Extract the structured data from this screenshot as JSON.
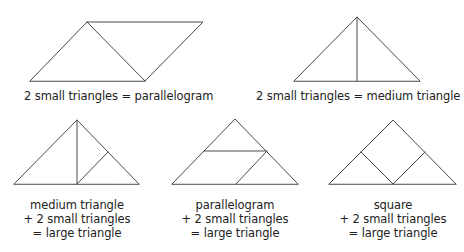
{
  "figures": [
    {
      "id": "parallelogram-from-2-small",
      "caption_lines": [
        "2 small triangles = parallelogram"
      ],
      "outline": [
        [
          30,
          81
        ],
        [
          87,
          22
        ],
        [
          203,
          22
        ],
        [
          145,
          81
        ]
      ],
      "inner_lines": [
        [
          [
            87,
            22
          ],
          [
            145,
            81
          ]
        ]
      ]
    },
    {
      "id": "medium-from-2-small",
      "caption_lines": [
        "2 small triangles = medium triangle"
      ],
      "outline": [
        [
          294,
          81
        ],
        [
          357,
          17
        ],
        [
          420,
          81
        ]
      ],
      "inner_lines": [
        [
          [
            357,
            17
          ],
          [
            357,
            81
          ]
        ]
      ]
    },
    {
      "id": "large-from-medium-and-2-small",
      "caption_lines": [
        "medium triangle",
        "+ 2 small triangles",
        "= large triangle"
      ],
      "outline": [
        [
          14,
          184
        ],
        [
          77,
          120
        ],
        [
          139,
          184
        ]
      ],
      "inner_lines": [
        [
          [
            77,
            120
          ],
          [
            77,
            184
          ]
        ],
        [
          [
            77,
            184
          ],
          [
            108,
            152
          ]
        ]
      ]
    },
    {
      "id": "large-from-parallelogram-and-2-small",
      "caption_lines": [
        "parallelogram",
        "+ 2 small triangles",
        "= large triangle"
      ],
      "outline": [
        [
          172,
          184
        ],
        [
          235,
          119
        ],
        [
          298,
          184
        ]
      ],
      "inner_lines": [
        [
          [
            204,
            151
          ],
          [
            267,
            151
          ]
        ],
        [
          [
            236,
            184
          ],
          [
            267,
            151
          ]
        ]
      ]
    },
    {
      "id": "large-from-square-and-2-small",
      "caption_lines": [
        "square",
        "+ 2 small triangles",
        "= large triangle"
      ],
      "outline": [
        [
          329,
          184
        ],
        [
          393,
          120
        ],
        [
          456,
          184
        ]
      ],
      "inner_lines": [
        [
          [
            361,
            152
          ],
          [
            393,
            184
          ]
        ],
        [
          [
            393,
            184
          ],
          [
            425,
            152
          ]
        ]
      ]
    }
  ],
  "colors": {
    "stroke": "#4a4a4a",
    "text": "#222222",
    "background": "#ffffff"
  }
}
